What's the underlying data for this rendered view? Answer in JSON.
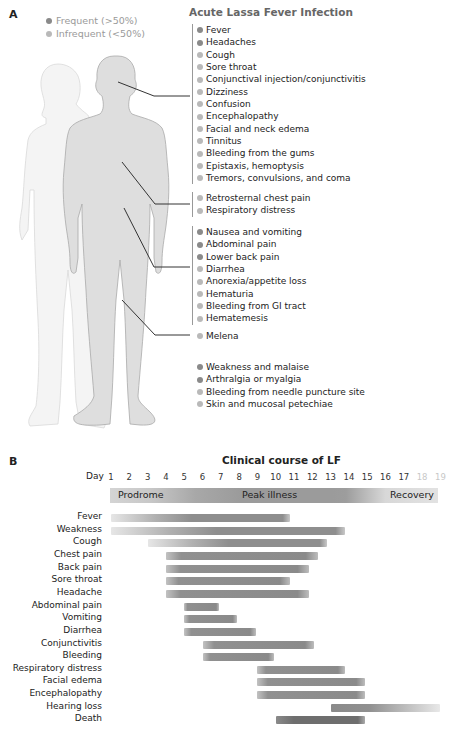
{
  "panel_a": {
    "letter": "A",
    "title": "Acute Lassa Fever Infection",
    "legend": [
      {
        "label": "Frequent (>50%)",
        "kind": "frequent",
        "color": "#8a8a8a"
      },
      {
        "label": "Infrequent (<50%)",
        "kind": "infrequent",
        "color": "#b9b9b9"
      }
    ],
    "groups": [
      {
        "region": "head",
        "items": [
          {
            "label": "Fever",
            "frequent": true
          },
          {
            "label": "Headaches",
            "frequent": true
          },
          {
            "label": "Cough",
            "frequent": false
          },
          {
            "label": "Sore throat",
            "frequent": false
          },
          {
            "label": "Conjunctival injection/conjunctivitis",
            "frequent": false
          },
          {
            "label": "Dizziness",
            "frequent": false
          },
          {
            "label": "Confusion",
            "frequent": false
          },
          {
            "label": "Encephalopathy",
            "frequent": false
          },
          {
            "label": "Facial and neck edema",
            "frequent": false
          },
          {
            "label": "Tinnitus",
            "frequent": false
          },
          {
            "label": "Bleeding from the gums",
            "frequent": false
          },
          {
            "label": "Epistaxis, hemoptysis",
            "frequent": false
          },
          {
            "label": "Tremors, convulsions, and coma",
            "frequent": false
          }
        ]
      },
      {
        "region": "chest",
        "items": [
          {
            "label": "Retrosternal chest pain",
            "frequent": false
          },
          {
            "label": "Respiratory distress",
            "frequent": false
          }
        ]
      },
      {
        "region": "abdomen",
        "items": [
          {
            "label": "Nausea and vomiting",
            "frequent": true
          },
          {
            "label": "Abdominal pain",
            "frequent": true
          },
          {
            "label": "Lower back pain",
            "frequent": true
          },
          {
            "label": "Diarrhea",
            "frequent": false
          },
          {
            "label": "Anorexia/appetite loss",
            "frequent": false
          },
          {
            "label": "Hematuria",
            "frequent": false
          },
          {
            "label": "Bleeding from GI tract",
            "frequent": false
          },
          {
            "label": "Hematemesis",
            "frequent": false
          }
        ]
      },
      {
        "region": "lower",
        "items": [
          {
            "label": "Melena",
            "frequent": false
          }
        ]
      },
      {
        "region": "systemic",
        "items": [
          {
            "label": "Weakness and malaise",
            "frequent": true
          },
          {
            "label": "Arthralgia or myalgia",
            "frequent": true
          },
          {
            "label": "Bleeding from needle puncture site",
            "frequent": false
          },
          {
            "label": "Skin and mucosal petechiae",
            "frequent": false
          }
        ]
      }
    ]
  },
  "panel_b": {
    "letter": "B",
    "title": "Clinical course of LF",
    "day_label": "Day",
    "days": [
      1,
      2,
      3,
      4,
      5,
      6,
      7,
      8,
      9,
      10,
      11,
      12,
      13,
      14,
      15,
      16,
      17,
      18,
      19
    ],
    "faded_days": [
      18,
      19
    ],
    "phases": [
      {
        "label": "Prodrome",
        "start": 1,
        "end": 5
      },
      {
        "label": "Peak illness",
        "start": 6,
        "end": 14
      },
      {
        "label": "Recovery",
        "start": 15,
        "end": 19
      }
    ]
  },
  "chart_data": {
    "type": "gantt",
    "title": "Clinical course of LF",
    "xlabel": "Day",
    "xlim": [
      1,
      19
    ],
    "phases": [
      {
        "label": "Prodrome",
        "start": 1,
        "end": 5
      },
      {
        "label": "Peak illness",
        "start": 6,
        "end": 14
      },
      {
        "label": "Recovery",
        "start": 15,
        "end": 19
      }
    ],
    "series": [
      {
        "name": "Fever",
        "start": 1,
        "end": 10.8,
        "fade_in": true
      },
      {
        "name": "Weakness",
        "start": 1,
        "end": 13.8,
        "fade_in": true
      },
      {
        "name": "Cough",
        "start": 3,
        "end": 12.8,
        "fade_in": true
      },
      {
        "name": "Chest pain",
        "start": 4,
        "end": 12.3,
        "fade_in": false
      },
      {
        "name": "Back pain",
        "start": 4,
        "end": 11.8,
        "fade_in": false
      },
      {
        "name": "Sore throat",
        "start": 4,
        "end": 10.8,
        "fade_in": false
      },
      {
        "name": "Headache",
        "start": 4,
        "end": 11.8,
        "fade_in": false
      },
      {
        "name": "Abdominal pain",
        "start": 5,
        "end": 6.9,
        "fade_in": false
      },
      {
        "name": "Vomiting",
        "start": 5,
        "end": 7.9,
        "fade_in": false
      },
      {
        "name": "Diarrhea",
        "start": 5,
        "end": 8.9,
        "fade_in": false
      },
      {
        "name": "Conjunctivitis",
        "start": 6,
        "end": 12.1,
        "fade_in": false
      },
      {
        "name": "Bleeding",
        "start": 6,
        "end": 9.9,
        "fade_in": false
      },
      {
        "name": "Respiratory distress",
        "start": 9,
        "end": 13.8,
        "fade_in": false
      },
      {
        "name": "Facial edema",
        "start": 9,
        "end": 14.9,
        "fade_in": false
      },
      {
        "name": "Encephalopathy",
        "start": 9,
        "end": 14.9,
        "fade_in": false
      },
      {
        "name": "Hearing loss",
        "start": 13,
        "end": 19,
        "fade_out": true
      },
      {
        "name": "Death",
        "start": 10,
        "end": 14.9,
        "fade_in": false
      }
    ]
  }
}
